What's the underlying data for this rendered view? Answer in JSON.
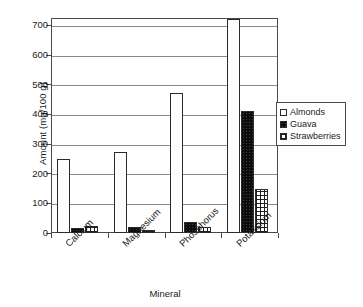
{
  "chart_data": {
    "type": "bar",
    "title": "",
    "xlabel": "Mineral",
    "ylabel": "Amount (mg/100 g)",
    "categories": [
      "Calcium",
      "Magnesium",
      "Phosphorus",
      "Potassium"
    ],
    "series": [
      {
        "name": "Almonds",
        "values": [
          248,
          272,
          471,
          722
        ],
        "pattern": "dotted-light",
        "color": "#fdfdfd"
      },
      {
        "name": "Guava",
        "values": [
          18,
          20,
          36,
          412
        ],
        "pattern": "solid-black",
        "color": "#0d0d0d"
      },
      {
        "name": "Strawberries",
        "values": [
          23,
          10,
          20,
          150
        ],
        "pattern": "crosshatch",
        "color": "#ffffff"
      }
    ],
    "ylim": [
      0,
      725
    ],
    "yticks": [
      0,
      100,
      200,
      300,
      400,
      500,
      600,
      700
    ],
    "ytick_labels": [
      "0",
      "100",
      "200",
      "300",
      "400",
      "500",
      "600",
      "700"
    ],
    "grid": true,
    "grid_axis": "y",
    "legend_position": "right",
    "xtick_rotation": -45
  },
  "legend": {
    "entries": [
      {
        "label": "Almonds"
      },
      {
        "label": "Guava"
      },
      {
        "label": "Strawberries"
      }
    ]
  }
}
